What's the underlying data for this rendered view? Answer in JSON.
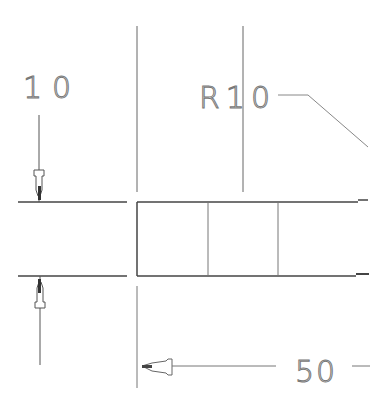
{
  "drawing": {
    "type": "technical-drawing",
    "background": "#ffffff",
    "line_color": "#555555",
    "dimensions": {
      "vertical_dim": {
        "label": "10",
        "position": "left"
      },
      "radius_dim": {
        "label": "R10",
        "position": "top-right"
      },
      "horizontal_dim": {
        "label": "50",
        "position": "bottom"
      }
    },
    "part": {
      "shape": "rectangular-section",
      "inner_divisions": 2
    }
  }
}
